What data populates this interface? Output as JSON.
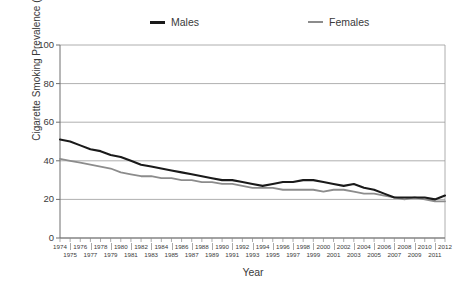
{
  "figure": {
    "x_axis_title": "Year",
    "y_axis_title": "Cigarette Smoking Prevalence (%)"
  },
  "legend": {
    "items": [
      {
        "label": "Males",
        "color": "#1a1a1a",
        "marker": "line-swatch"
      },
      {
        "label": "Females",
        "color": "#8c8c8c",
        "marker": "line-swatch"
      }
    ]
  },
  "axes": {
    "y_ticks": [
      "0",
      "20",
      "40",
      "60",
      "80",
      "100"
    ],
    "x_ticks_top": [
      "1974",
      "1976",
      "1978",
      "1980",
      "1982",
      "1984",
      "1986",
      "1988",
      "1990",
      "1992",
      "1994",
      "1996",
      "1998",
      "2000",
      "2002",
      "2004",
      "2006",
      "2008",
      "2010",
      "2012"
    ],
    "x_ticks_bottom": [
      "1975",
      "1977",
      "1979",
      "1981",
      "1983",
      "1985",
      "1987",
      "1989",
      "1991",
      "1993",
      "1995",
      "1997",
      "1999",
      "2001",
      "2003",
      "2005",
      "2007",
      "2009",
      "2011"
    ]
  },
  "chart_data": {
    "type": "line",
    "title": "",
    "xlabel": "Year",
    "ylabel": "Cigarette Smoking Prevalence (%)",
    "xlim": [
      1974,
      2012
    ],
    "ylim": [
      0,
      100
    ],
    "yticks": [
      0,
      20,
      40,
      60,
      80,
      100
    ],
    "grid": "horizontal",
    "legend_position": "top",
    "x": [
      1974,
      1975,
      1976,
      1977,
      1978,
      1979,
      1980,
      1981,
      1982,
      1983,
      1984,
      1985,
      1986,
      1987,
      1988,
      1989,
      1990,
      1991,
      1992,
      1993,
      1994,
      1995,
      1996,
      1997,
      1998,
      1999,
      2000,
      2001,
      2002,
      2003,
      2004,
      2005,
      2006,
      2007,
      2008,
      2009,
      2010,
      2011,
      2012
    ],
    "series": [
      {
        "name": "Males",
        "color": "#1a1a1a",
        "values": [
          51,
          50,
          48,
          46,
          45,
          43,
          42,
          40,
          38,
          37,
          36,
          35,
          34,
          33,
          32,
          31,
          30,
          30,
          29,
          28,
          27,
          28,
          29,
          29,
          30,
          30,
          29,
          28,
          27,
          28,
          26,
          25,
          23,
          21,
          21,
          21,
          21,
          20,
          22
        ]
      },
      {
        "name": "Females",
        "color": "#8c8c8c",
        "values": [
          41,
          40,
          39,
          38,
          37,
          36,
          34,
          33,
          32,
          32,
          31,
          31,
          30,
          30,
          29,
          29,
          28,
          28,
          27,
          26,
          26,
          26,
          25,
          25,
          25,
          25,
          24,
          25,
          25,
          24,
          23,
          23,
          22,
          21,
          20,
          21,
          20,
          19,
          19
        ]
      }
    ]
  }
}
